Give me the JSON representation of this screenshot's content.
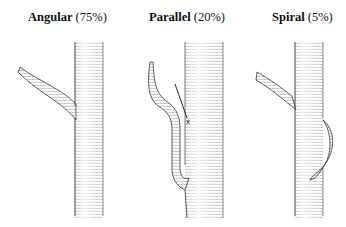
{
  "figure": {
    "panels": [
      {
        "name": "Angular",
        "percent": "(75%)"
      },
      {
        "name": "Parallel",
        "percent": "(20%)"
      },
      {
        "name": "Spiral",
        "percent": "(5%)"
      }
    ],
    "annotation_marker": "x"
  }
}
